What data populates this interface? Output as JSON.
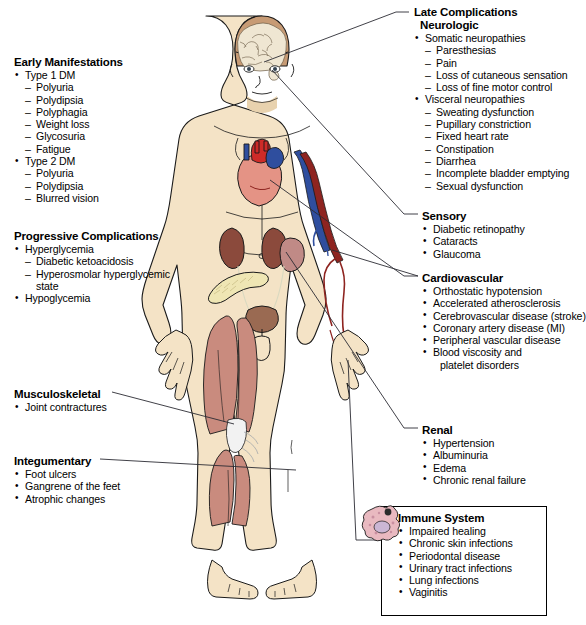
{
  "diagram": {
    "figure": "anterior-view-male-body-with-brain-heart-kidneys-pancreas-bladder-vessels-muscles"
  },
  "colors": {
    "skin": "#F4E3C6",
    "skin_shade": "#E8D2AE",
    "outline": "#1a1a1a",
    "brain": "#EFE6D2",
    "hair": "#C79B75",
    "heart_muscle": "#E49385",
    "artery": "#CE2B28",
    "artery_dark": "#8E2420",
    "vein": "#2F4E9E",
    "kidney": "#8B4A3C",
    "spleen": "#C08A86",
    "pancreas": "#EFE6B4",
    "muscle": "#C98B7E",
    "tendon": "#F2F2F2",
    "bladder": "#9A6A52",
    "immune_cell": "#E9B9C0",
    "leader": "#2b2b33",
    "background": "#FFFFFF"
  },
  "left_column": {
    "early": {
      "title": "Early Manifestations",
      "groups": [
        {
          "label": "Type 1 DM",
          "items": [
            "Polyuria",
            "Polydipsia",
            "Polyphagia",
            "Weight loss",
            "Glycosuria",
            "Fatigue"
          ]
        },
        {
          "label": "Type 2 DM",
          "items": [
            "Polyuria",
            "Polydipsia",
            "Blurred vision"
          ]
        }
      ]
    },
    "progressive": {
      "title": "Progressive Complications",
      "groups": [
        {
          "label": "Hyperglycemia",
          "items": [
            "Diabetic ketoacidosis",
            "Hyperosmolar hyperglycemic",
            "state"
          ]
        },
        {
          "label": "Hypoglycemia",
          "items": []
        }
      ]
    },
    "musculoskeletal": {
      "title": "Musculoskeletal",
      "items": [
        "Joint contractures"
      ]
    },
    "integumentary": {
      "title": "Integumentary",
      "items": [
        "Foot ulcers",
        "Gangrene of the feet",
        "Atrophic changes"
      ]
    }
  },
  "right_column": {
    "late": {
      "title": "Late Complications",
      "subtitle": "Neurologic",
      "groups": [
        {
          "label": "Somatic neuropathies",
          "items": [
            "Paresthesias",
            "Pain",
            "Loss of cutaneous sensation",
            "Loss of fine motor control"
          ]
        },
        {
          "label": "Visceral neuropathies",
          "items": [
            "Sweating dysfunction",
            "Pupillary constriction",
            "Fixed heart rate",
            "Constipation",
            "Diarrhea",
            "Incomplete bladder emptying",
            "Sexual dysfunction"
          ]
        }
      ]
    },
    "sensory": {
      "title": "Sensory",
      "items": [
        "Diabetic retinopathy",
        "Cataracts",
        "Glaucoma"
      ]
    },
    "cardiovascular": {
      "title": "Cardiovascular",
      "items": [
        "Orthostatic hypotension",
        "Accelerated atherosclerosis",
        "Cerebrovascular disease (stroke)",
        "Coronary artery disease (MI)",
        "Peripheral vascular disease",
        "Blood viscosity and"
      ],
      "continuation": "platelet disorders"
    },
    "renal": {
      "title": "Renal",
      "items": [
        "Hypertension",
        "Albuminuria",
        "Edema",
        "Chronic renal failure"
      ]
    },
    "immune": {
      "title": "Immune System",
      "items": [
        "Impaired healing",
        "Chronic skin infections",
        "Periodontal disease",
        "Urinary tract infections",
        "Lung infections",
        "Vaginitis"
      ]
    }
  }
}
